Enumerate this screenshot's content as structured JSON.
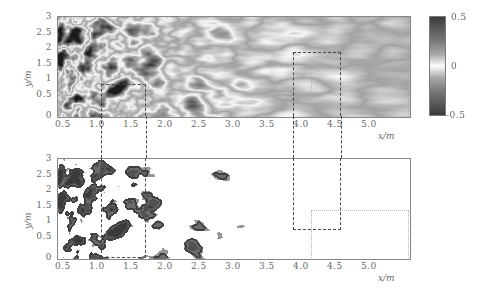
{
  "figure": {
    "type": "two-panel-contour-field"
  },
  "colorbar": {
    "name": "grayscale-diverging",
    "ticks": [
      "0.5",
      "0",
      "-0.5"
    ],
    "vmin": -0.5,
    "vmax": 0.5,
    "colors": {
      "max": "#3a3a3a",
      "mid": "#fbfbfb",
      "min": "#3a3a3a",
      "background": "#a0a0a0"
    }
  },
  "panels": [
    {
      "id": "upper",
      "name": "instantaneous-scalar-field",
      "xlabel": "x/m",
      "ylabel": "y/m",
      "xticks": [
        "0.5",
        "1.0",
        "1.5",
        "2.0",
        "2.5",
        "3.0",
        "3.5",
        "4.0",
        "4.5",
        "5.0"
      ],
      "xtick_values": [
        0.5,
        1.0,
        1.5,
        2.0,
        2.5,
        3.0,
        3.5,
        4.0,
        4.5,
        5.0
      ],
      "yticks": [
        "0",
        "0.5",
        "1",
        "1.5",
        "2",
        "2.5",
        "3"
      ],
      "ytick_values": [
        0,
        0.5,
        1,
        1.5,
        2,
        2.5,
        3
      ],
      "xlim": [
        0,
        5.15
      ],
      "ylim": [
        0,
        3.2
      ],
      "render": "smooth-grayscale"
    },
    {
      "id": "lower",
      "name": "thresholded-scalar-field",
      "xlabel": "x/m",
      "ylabel": "y/m",
      "xticks": [
        "0.5",
        "1.0",
        "1.5",
        "2.0",
        "2.5",
        "3.0",
        "3.5",
        "4.0",
        "4.5",
        "5.0"
      ],
      "xtick_values": [
        0.5,
        1.0,
        1.5,
        2.0,
        2.5,
        3.0,
        3.5,
        4.0,
        4.5,
        5.0
      ],
      "yticks": [
        "0",
        "0.5",
        "1",
        "1.5",
        "2",
        "2.5",
        "3"
      ],
      "ytick_values": [
        0,
        0.5,
        1,
        1.5,
        2,
        2.5,
        3
      ],
      "xlim": [
        0,
        5.15
      ],
      "ylim": [
        0,
        3.2
      ],
      "render": "binarized-contour"
    }
  ],
  "annotations": {
    "zoom_box_left": {
      "name": "zoom-region-left",
      "x0": 0.64,
      "x1": 1.3,
      "y_top_upper": 1.0,
      "y_bottom_lower": 0.0
    },
    "zoom_box_right": {
      "name": "zoom-region-right",
      "x0": 3.45,
      "x1": 4.15,
      "y_top_upper": 2.05,
      "y_bottom_lower": 0.95
    },
    "guide_line_y": {
      "name": "guide-line",
      "y": 1.5,
      "x_start": 3.72,
      "x_end": 5.15
    },
    "guide_box": {
      "name": "guide-box",
      "x0": 3.72,
      "x1": 5.15,
      "y_bottom": 0.0,
      "y_top": 1.5
    }
  }
}
